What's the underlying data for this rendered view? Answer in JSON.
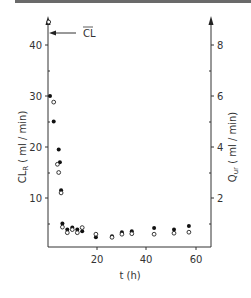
{
  "chart_data": {
    "type": "scatter",
    "title": "",
    "xlabel": "t (h)",
    "ylabel": "CL_R (ml / min)",
    "ylabel_right": "Q_ur (ml / min)",
    "xlim": [
      0,
      65
    ],
    "ylim": [
      0,
      46
    ],
    "ylim_right": [
      0,
      9.2
    ],
    "x_ticks": [
      20,
      40,
      60
    ],
    "y_ticks": [
      10,
      20,
      30,
      40
    ],
    "y_minor_ticks": [
      5,
      15,
      25,
      35
    ],
    "y_right_ticks": [
      2,
      4,
      6,
      8
    ],
    "y_right_minor_ticks": [
      1,
      3,
      5,
      7
    ],
    "grid": false,
    "annotations": [
      {
        "text": "CL",
        "overline": true,
        "points_to_y": 43,
        "description": "mean clearance arrow at CL ≈ 43"
      }
    ],
    "series": [
      {
        "name": "CL_R (filled circles)",
        "marker": "filled-circle",
        "axis": "left",
        "x": [
          1,
          2.5,
          4.5,
          5,
          5.5,
          6,
          8,
          10,
          12,
          14,
          19.5,
          26,
          30,
          34,
          43,
          51,
          57
        ],
        "y": [
          30,
          25,
          19.5,
          17,
          11.5,
          5,
          3.8,
          4.2,
          3.8,
          3.5,
          2.3,
          2.5,
          3.3,
          3.5,
          4.1,
          3.8,
          4.5
        ]
      },
      {
        "name": "Q_ur (open circles)",
        "marker": "open-circle",
        "axis": "right",
        "x": [
          0.5,
          2.5,
          4,
          4.5,
          5.5,
          6,
          8,
          10,
          12,
          14,
          19.5,
          26,
          30,
          34,
          43,
          51,
          57
        ],
        "y": [
          8.9,
          5.76,
          3.32,
          3.0,
          2.2,
          0.86,
          0.64,
          0.76,
          0.64,
          0.84,
          0.58,
          0.46,
          0.58,
          0.6,
          0.58,
          0.62,
          0.66
        ]
      }
    ]
  },
  "labels": {
    "x_title": "t (h)",
    "y_left_title_main": "CL",
    "y_left_title_sub": "R",
    "y_left_title_unit": " ( ml / min)",
    "y_right_title_main": "Q",
    "y_right_title_sub": "ur",
    "y_right_title_unit": " ( ml / min)",
    "annotation": "CL",
    "x_tick_20": "20",
    "x_tick_40": "40",
    "x_tick_60": "60",
    "y_tick_10": "10",
    "y_tick_20": "20",
    "y_tick_30": "30",
    "y_tick_40": "40",
    "yr_tick_2": "2",
    "yr_tick_4": "4",
    "yr_tick_6": "6",
    "yr_tick_8": "8"
  }
}
